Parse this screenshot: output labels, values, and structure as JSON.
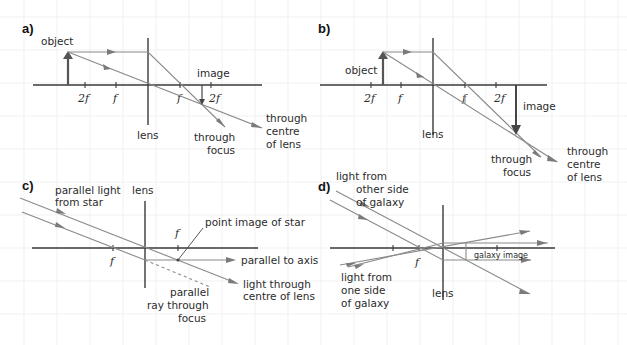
{
  "figure": {
    "type": "lens ray diagrams",
    "colors": {
      "axis": "#3a3a3a",
      "ray": "#8a8a8a",
      "object": "#555555",
      "grid": "#f1f1f1",
      "background": "#ffffff"
    }
  },
  "panels": {
    "a": {
      "label": "a)",
      "object_label": "object",
      "image_label": "image",
      "lens_label": "lens",
      "ticks": [
        "2f",
        "f",
        "f",
        "2f"
      ],
      "ray1_label_line1": "through",
      "ray1_label_line2": "focus",
      "ray2_label_line1": "through",
      "ray2_label_line2": "centre",
      "ray2_label_line3": "of lens"
    },
    "b": {
      "label": "b)",
      "object_label": "object",
      "image_label": "image",
      "lens_label": "lens",
      "ticks": [
        "2f",
        "f",
        "f",
        "2f"
      ],
      "ray1_label_line1": "through",
      "ray1_label_line2": "focus",
      "ray2_label_line1": "through",
      "ray2_label_line2": "centre",
      "ray2_label_line3": "of lens"
    },
    "c": {
      "label": "c)",
      "source_label_line1": "parallel light",
      "source_label_line2": "from star",
      "lens_label": "lens",
      "ticks": [
        "f",
        "f"
      ],
      "point_label": "point image of star",
      "parallel_label": "parallel to axis",
      "centre_label_line1": "light through",
      "centre_label_line2": "centre of lens",
      "dashed_label_line1": "parallel",
      "dashed_label_line2": "ray through",
      "dashed_label_line3": "focus"
    },
    "d": {
      "label": "d)",
      "top_label_line1": "light from",
      "top_label_line2": "other side",
      "top_label_line3": "of galaxy",
      "bottom_label_line1": "light from",
      "bottom_label_line2": "one side",
      "bottom_label_line3": "of galaxy",
      "lens_label": "lens",
      "ticks": [
        "f"
      ],
      "image_label": "galaxy image"
    }
  }
}
